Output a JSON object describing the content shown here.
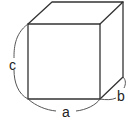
{
  "diagram": {
    "type": "cube",
    "labels": {
      "width": "a",
      "depth": "b",
      "height": "c"
    },
    "stroke_color": "#333333",
    "background": "#ffffff"
  }
}
